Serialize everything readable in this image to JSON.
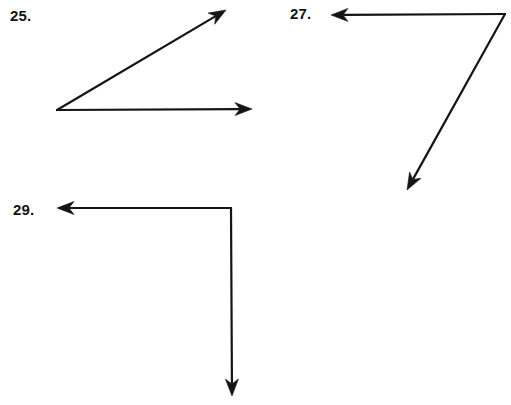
{
  "page": {
    "background_color": "#ffffff",
    "ink_color": "#141414",
    "width": 511,
    "height": 405
  },
  "figures": [
    {
      "label": "25.",
      "name": "figure-25",
      "description": "acute angle opening to the right, vertex at lower left with one horizontal ray and one ray rising to the upper right",
      "label_position": {
        "x": 10,
        "y": 8
      },
      "vertex": {
        "x": 57,
        "y": 110
      },
      "rays": [
        {
          "name": "ray-25-upper",
          "direction": "upper-right",
          "from": {
            "x": 57,
            "y": 110
          },
          "to": {
            "x": 226,
            "y": 10
          },
          "arrowhead": "end"
        },
        {
          "name": "ray-25-horizontal",
          "direction": "right",
          "from": {
            "x": 57,
            "y": 110
          },
          "to": {
            "x": 252,
            "y": 109
          },
          "arrowhead": "end"
        }
      ]
    },
    {
      "label": "27.",
      "name": "figure-27",
      "description": "obtuse-looking angle with vertex at upper right, one horizontal ray pointing left and one ray descending to the lower left",
      "label_position": {
        "x": 290,
        "y": 6
      },
      "vertex": {
        "x": 505,
        "y": 14
      },
      "rays": [
        {
          "name": "ray-27-horizontal",
          "direction": "left",
          "from": {
            "x": 505,
            "y": 14
          },
          "to": {
            "x": 331,
            "y": 15
          },
          "arrowhead": "end"
        },
        {
          "name": "ray-27-descending",
          "direction": "lower-left",
          "from": {
            "x": 505,
            "y": 14
          },
          "to": {
            "x": 407,
            "y": 190
          },
          "arrowhead": "end"
        }
      ]
    },
    {
      "label": "29.",
      "name": "figure-29",
      "description": "right angle with vertex at upper right, one horizontal ray pointing left and one vertical ray pointing down",
      "label_position": {
        "x": 13,
        "y": 202
      },
      "vertex": {
        "x": 231,
        "y": 208
      },
      "rays": [
        {
          "name": "ray-29-horizontal",
          "direction": "left",
          "from": {
            "x": 231,
            "y": 208
          },
          "to": {
            "x": 57,
            "y": 208
          },
          "arrowhead": "end"
        },
        {
          "name": "ray-29-vertical",
          "direction": "down",
          "from": {
            "x": 231,
            "y": 208
          },
          "to": {
            "x": 232,
            "y": 396
          },
          "arrowhead": "end"
        }
      ]
    }
  ],
  "style": {
    "stroke_width": 2.2,
    "arrow_length": 17,
    "arrow_half_width": 6.5,
    "arrow_notch": 5
  }
}
